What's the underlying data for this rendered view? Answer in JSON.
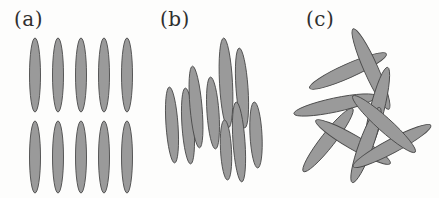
{
  "figure": {
    "width": 439,
    "height": 198,
    "background_color": "#fdfdfc",
    "rod_fill_color": "#9a9a9a",
    "rod_outline_color": "#4a4a4a"
  },
  "panels": [
    {
      "id": "a",
      "label": "(a)",
      "description": "smectic-like: rods aligned vertically and arranged in two regular rows",
      "rod_count": 10
    },
    {
      "id": "b",
      "label": "(b)",
      "description": "nematic-like: rods roughly aligned but positionally disordered",
      "rod_count": 9
    },
    {
      "id": "c",
      "label": "(c)",
      "description": "isotropic: rods randomly oriented and positioned",
      "rod_count": 9
    }
  ],
  "chart_data": {
    "type": "scatter",
    "title": "",
    "xlabel": "",
    "ylabel": "",
    "grid": false,
    "legend": "none",
    "xlim": [
      0,
      439
    ],
    "ylim": [
      0,
      198
    ],
    "note": "Three-panel schematic of rod-like particle (ellipse) arrangements. Each rod is an ellipse given by center x, center y, semi-major axis rx, semi-minor axis ry, and rotation angle in degrees (clockwise from vertical, i.e. ellipse long axis along local y).",
    "series": [
      {
        "name": "(a) ordered rows",
        "panel": "a",
        "values": [
          {
            "cx": 35,
            "cy": 75,
            "rx": 5.5,
            "ry": 37,
            "angle": 0
          },
          {
            "cx": 58,
            "cy": 75,
            "rx": 5.5,
            "ry": 37,
            "angle": 0
          },
          {
            "cx": 81,
            "cy": 75,
            "rx": 5.5,
            "ry": 37,
            "angle": 0
          },
          {
            "cx": 104,
            "cy": 75,
            "rx": 5.5,
            "ry": 37,
            "angle": 0
          },
          {
            "cx": 127,
            "cy": 75,
            "rx": 5.5,
            "ry": 37,
            "angle": 0
          },
          {
            "cx": 35,
            "cy": 157,
            "rx": 5.5,
            "ry": 36,
            "angle": 0
          },
          {
            "cx": 58,
            "cy": 157,
            "rx": 5.5,
            "ry": 36,
            "angle": 0
          },
          {
            "cx": 81,
            "cy": 157,
            "rx": 5.5,
            "ry": 36,
            "angle": 0
          },
          {
            "cx": 104,
            "cy": 157,
            "rx": 5.5,
            "ry": 36,
            "angle": 0
          },
          {
            "cx": 127,
            "cy": 157,
            "rx": 5.5,
            "ry": 36,
            "angle": 0
          }
        ]
      },
      {
        "name": "(b) aligned, disordered positions",
        "panel": "b",
        "values": [
          {
            "cx": 26,
            "cy": 125,
            "rx": 6,
            "ry": 38,
            "angle": -4
          },
          {
            "cx": 42,
            "cy": 126,
            "rx": 6,
            "ry": 38,
            "angle": -4
          },
          {
            "cx": 50,
            "cy": 107,
            "rx": 6,
            "ry": 41,
            "angle": -5
          },
          {
            "cx": 67,
            "cy": 113,
            "rx": 6,
            "ry": 36,
            "angle": -4
          },
          {
            "cx": 80,
            "cy": 83,
            "rx": 6.5,
            "ry": 45,
            "angle": -3
          },
          {
            "cx": 96,
            "cy": 88,
            "rx": 6,
            "ry": 40,
            "angle": -4
          },
          {
            "cx": 93,
            "cy": 142,
            "rx": 6,
            "ry": 40,
            "angle": -4
          },
          {
            "cx": 110,
            "cy": 135,
            "rx": 6,
            "ry": 33,
            "angle": -3
          },
          {
            "cx": 80,
            "cy": 150,
            "rx": 5.5,
            "ry": 30,
            "angle": -3
          }
        ]
      },
      {
        "name": "(c) isotropic, random orientations",
        "panel": "c",
        "values": [
          {
            "cx": 56,
            "cy": 71,
            "rx": 7,
            "ry": 42,
            "angle": 66
          },
          {
            "cx": 79,
            "cy": 69,
            "rx": 7,
            "ry": 44,
            "angle": -24
          },
          {
            "cx": 43,
            "cy": 105,
            "rx": 7,
            "ry": 42,
            "angle": 78
          },
          {
            "cx": 85,
            "cy": 110,
            "rx": 7,
            "ry": 44,
            "angle": 14
          },
          {
            "cx": 36,
            "cy": 140,
            "rx": 7,
            "ry": 40,
            "angle": 38
          },
          {
            "cx": 61,
            "cy": 142,
            "rx": 7,
            "ry": 43,
            "angle": 120
          },
          {
            "cx": 74,
            "cy": 145,
            "rx": 7,
            "ry": 40,
            "angle": 20
          },
          {
            "cx": 100,
            "cy": 146,
            "rx": 7,
            "ry": 44,
            "angle": 62
          },
          {
            "cx": 92,
            "cy": 124,
            "rx": 7,
            "ry": 42,
            "angle": 132
          }
        ]
      }
    ]
  }
}
